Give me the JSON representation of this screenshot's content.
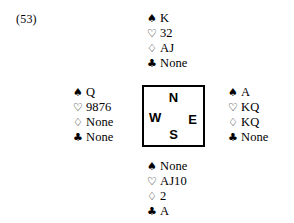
{
  "diagram": {
    "problem_number": "(53)",
    "suit_symbols": {
      "spades": "♠",
      "hearts": "♡",
      "diamonds": "♢",
      "clubs": "♣"
    },
    "compass": {
      "north": "N",
      "south": "S",
      "east": "E",
      "west": "W"
    },
    "hands": {
      "north": {
        "spades": "K",
        "hearts": "32",
        "diamonds": "AJ",
        "clubs": "None"
      },
      "west": {
        "spades": "Q",
        "hearts": "9876",
        "diamonds": "None",
        "clubs": "None"
      },
      "east": {
        "spades": "A",
        "hearts": "KQ",
        "diamonds": "KQ",
        "clubs": "None"
      },
      "south": {
        "spades": "None",
        "hearts": "AJ10",
        "diamonds": "2",
        "clubs": "A"
      }
    }
  }
}
